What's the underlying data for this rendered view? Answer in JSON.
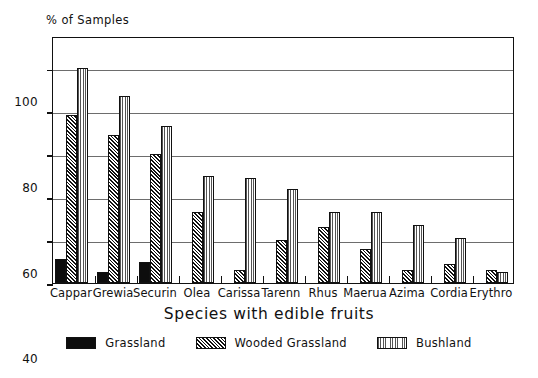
{
  "chart_data": {
    "type": "bar",
    "title": "",
    "xlabel": "Species with edible fruits",
    "ylabel": "% of Samples",
    "ylim": [
      0,
      115
    ],
    "yticks": [
      0,
      20,
      40,
      60,
      80,
      100
    ],
    "ytick_labels": [
      "0",
      "20",
      "40",
      "60",
      "80",
      "100"
    ],
    "grid": true,
    "legend_position": "bottom",
    "categories": [
      "Cappar",
      "Grewia",
      "Securin",
      "Olea",
      "Carissa",
      "Tarenn",
      "Rhus",
      "Maerua",
      "Azima",
      "Cordia",
      "Erythro"
    ],
    "series": [
      {
        "name": "Grassland",
        "pattern": "solid-black",
        "color": "#0d0d0d",
        "values": [
          11,
          5,
          10,
          0,
          0,
          0,
          0,
          0,
          0,
          0,
          0
        ]
      },
      {
        "name": "Wooded Grassland",
        "pattern": "diagonal-hatch",
        "color": "#2a2a2a",
        "values": [
          78,
          69,
          60,
          33,
          6,
          20,
          26,
          16,
          6,
          9,
          6
        ]
      },
      {
        "name": "Bushland",
        "pattern": "dotted-stipple",
        "color": "#a8a8a8",
        "values": [
          100,
          87,
          73,
          50,
          49,
          44,
          33,
          33,
          27,
          21,
          5
        ]
      }
    ]
  },
  "legend": {
    "items": [
      {
        "label": "Grassland",
        "swatch": "legend-swatch-grassland"
      },
      {
        "label": "Wooded Grassland",
        "swatch": "legend-swatch-wooded-grassland"
      },
      {
        "label": "Bushland",
        "swatch": "legend-swatch-bushland"
      }
    ]
  }
}
